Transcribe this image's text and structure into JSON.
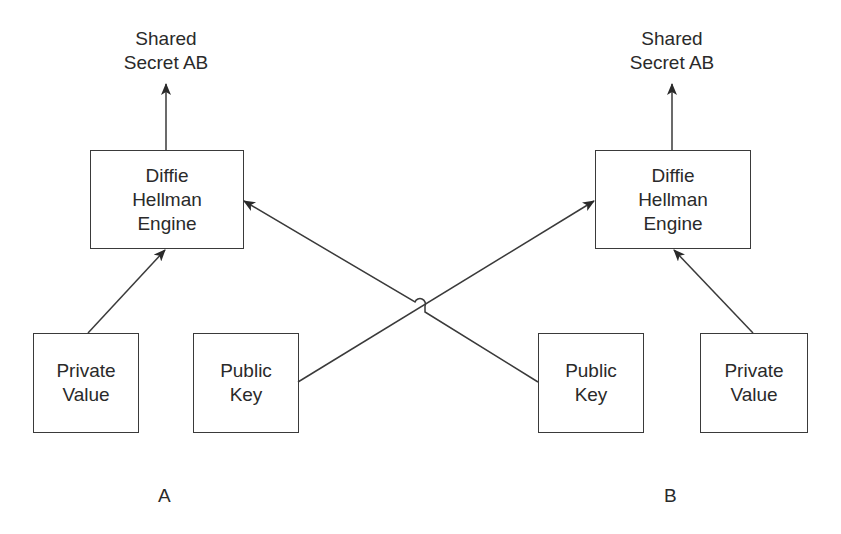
{
  "diagram": {
    "party_a": {
      "label": "A",
      "output": {
        "line1": "Shared",
        "line2": "Secret AB"
      },
      "engine": {
        "line1": "Diffie",
        "line2": "Hellman",
        "line3": "Engine"
      },
      "private_value": {
        "line1": "Private",
        "line2": "Value"
      },
      "public_key": {
        "line1": "Public",
        "line2": "Key"
      }
    },
    "party_b": {
      "label": "B",
      "output": {
        "line1": "Shared",
        "line2": "Secret AB"
      },
      "engine": {
        "line1": "Diffie",
        "line2": "Hellman",
        "line3": "Engine"
      },
      "private_value": {
        "line1": "Private",
        "line2": "Value"
      },
      "public_key": {
        "line1": "Public",
        "line2": "Key"
      }
    },
    "edges": [
      {
        "from": "A.private_value",
        "to": "A.engine"
      },
      {
        "from": "A.engine",
        "to": "A.output"
      },
      {
        "from": "A.public_key",
        "to": "B.engine"
      },
      {
        "from": "B.public_key",
        "to": "A.engine"
      },
      {
        "from": "B.private_value",
        "to": "B.engine"
      },
      {
        "from": "B.engine",
        "to": "B.output"
      }
    ],
    "colors": {
      "stroke": "#3a3a3a",
      "text": "#2a2a2a",
      "background": "#ffffff"
    }
  }
}
